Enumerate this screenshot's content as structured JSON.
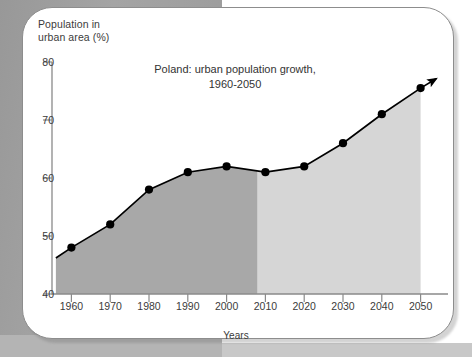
{
  "chart_data": {
    "type": "area",
    "title": "Poland: urban population growth,\n1960-2050",
    "xlabel": "Years",
    "ylabel": "Population in\nurban area (%)",
    "x": [
      1960,
      1970,
      1980,
      1990,
      2000,
      2010,
      2020,
      2030,
      2040,
      2050
    ],
    "values": [
      48,
      52,
      58,
      61,
      62,
      61,
      62,
      66,
      71,
      75.5
    ],
    "categories": [
      "1960",
      "1970",
      "1980",
      "1990",
      "2000",
      "2010",
      "2020",
      "2030",
      "2040",
      "2050"
    ],
    "xticks": [
      "1960",
      "1970",
      "1980",
      "1990",
      "2000",
      "2010",
      "2020",
      "2030",
      "2040",
      "2050"
    ],
    "yticks": [
      "40",
      "50",
      "60",
      "70",
      "80"
    ],
    "ylim": [
      40,
      80
    ],
    "xlim": [
      1955,
      2055
    ],
    "grid": false,
    "legend": "none",
    "annotations": [
      {
        "text": "Projected",
        "x": 2025,
        "y": 52
      }
    ],
    "series_split_year": 2008,
    "historical_fill": "#a8a8a8",
    "projected_fill": "#d6d6d6",
    "line_color": "#000000",
    "marker": "circle",
    "arrow_end": true
  },
  "card": {
    "border_color": "#8d8d8d"
  },
  "background": {
    "page_gray": "#9c9c9c"
  }
}
